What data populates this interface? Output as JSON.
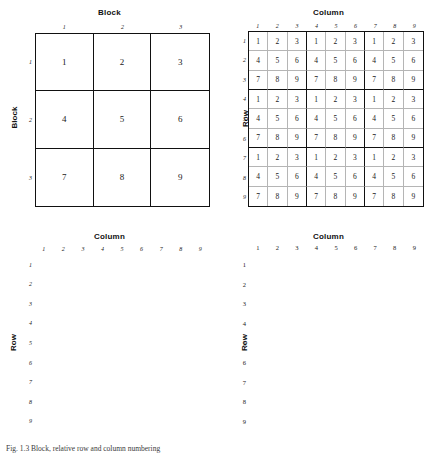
{
  "figure": {
    "caption": "Fig. 1.3 Block, relative row and column numbering"
  },
  "panels": [
    {
      "id": "block",
      "top_label": "Block",
      "side_label": "Block",
      "column_indices": [
        "1",
        "2",
        "3"
      ],
      "row_indices": [
        "1",
        "2",
        "3"
      ],
      "index_style": "italic",
      "grid_size": 3,
      "cells": [
        [
          "1",
          "2",
          "3"
        ],
        [
          "4",
          "5",
          "6"
        ],
        [
          "7",
          "8",
          "9"
        ]
      ]
    },
    {
      "id": "digits",
      "top_label": "Column",
      "side_label": "Row",
      "column_indices": [
        "1",
        "2",
        "3",
        "4",
        "5",
        "6",
        "7",
        "8",
        "9"
      ],
      "row_indices": [
        "1",
        "2",
        "3",
        "4",
        "5",
        "6",
        "7",
        "8",
        "9"
      ],
      "index_style": "italic",
      "grid_size": 9,
      "cells": [
        [
          "1",
          "2",
          "3",
          "1",
          "2",
          "3",
          "1",
          "2",
          "3"
        ],
        [
          "4",
          "5",
          "6",
          "4",
          "5",
          "6",
          "4",
          "5",
          "6"
        ],
        [
          "7",
          "8",
          "9",
          "7",
          "8",
          "9",
          "7",
          "8",
          "9"
        ],
        [
          "1",
          "2",
          "3",
          "1",
          "2",
          "3",
          "1",
          "2",
          "3"
        ],
        [
          "4",
          "5",
          "6",
          "4",
          "5",
          "6",
          "4",
          "5",
          "6"
        ],
        [
          "7",
          "8",
          "9",
          "7",
          "8",
          "9",
          "7",
          "8",
          "9"
        ],
        [
          "1",
          "2",
          "3",
          "1",
          "2",
          "3",
          "1",
          "2",
          "3"
        ],
        [
          "4",
          "5",
          "6",
          "4",
          "5",
          "6",
          "4",
          "5",
          "6"
        ],
        [
          "7",
          "8",
          "9",
          "7",
          "8",
          "9",
          "7",
          "8",
          "9"
        ]
      ]
    },
    {
      "id": "rowcol",
      "top_label": "Column",
      "side_label": "Row",
      "column_indices": [
        "1",
        "2",
        "3",
        "4",
        "5",
        "6",
        "7",
        "8",
        "9"
      ],
      "row_indices": [
        "1",
        "2",
        "3",
        "4",
        "5",
        "6",
        "7",
        "8",
        "9"
      ],
      "index_style": "italic",
      "grid_size": 9,
      "cells": [
        [
          "1,1",
          "1,2",
          "1,3",
          "1,4",
          "1,5",
          "1,6",
          "1,7",
          "1,8",
          "1,9"
        ],
        [
          "2,1",
          "2,2",
          "2,3",
          "2,4",
          "2,5",
          "2,6",
          "2,7",
          "2,8",
          "2,9"
        ],
        [
          "3,1",
          "3,2",
          "3,3",
          "3,4",
          "3,5",
          "3,6",
          "3,7",
          "3,8",
          "3,9"
        ],
        [
          "4,1",
          "4,2",
          "4,3",
          "4,4",
          "4,5",
          "4,6",
          "4,7",
          "4,8",
          "4,9"
        ],
        [
          "5,1",
          "5,2",
          "5,3",
          "5,4",
          "5,5",
          "5,6",
          "5,7",
          "5,8",
          "5,9"
        ],
        [
          "6,1",
          "6,2",
          "6,3",
          "6,4",
          "6,5",
          "6,6",
          "6,7",
          "6,8",
          "6,9"
        ],
        [
          "7,1",
          "7,2",
          "7,3",
          "7,4",
          "7,5",
          "7,6",
          "7,7",
          "7,8",
          "7,9"
        ],
        [
          "8,1",
          "8,2",
          "8,3",
          "8,4",
          "8,5",
          "8,6",
          "8,7",
          "8,8",
          "8,9"
        ],
        [
          "9,1",
          "9,2",
          "9,3",
          "9,4",
          "9,5",
          "9,6",
          "9,7",
          "9,8",
          "9,9"
        ]
      ]
    },
    {
      "id": "triple",
      "top_label": "Column",
      "side_label": "Row",
      "column_indices": [
        "1",
        "2",
        "3",
        "4",
        "5",
        "6",
        "7",
        "8",
        "9"
      ],
      "row_indices": [
        "1",
        "2",
        "3",
        "4",
        "5",
        "6",
        "7",
        "8",
        "9"
      ],
      "index_style": "upright",
      "grid_size": 9,
      "cells": [
        [
          "1,1,1",
          "1,1,2",
          "1,1,3",
          "2,1,4",
          "2,1,5",
          "2,1,6",
          "3,1,7",
          "3,1,8",
          "3,1,9"
        ],
        [
          "1,2,1",
          "1,2,2",
          "1,2,3",
          "2,2,4",
          "2,2,5",
          "2,2,6",
          "3,2,7",
          "3,2,8",
          "3,2,9"
        ],
        [
          "1,3,1",
          "1,3,2",
          "1,3,3",
          "2,3,4",
          "2,3,5",
          "2,3,6",
          "3,3,7",
          "3,3,8",
          "3,3,9"
        ],
        [
          "4,4,1",
          "4,4,2",
          "4,4,3",
          "5,4,4",
          "5,4,5",
          "5,4,6",
          "6,4,7",
          "6,4,8",
          "6,4,9"
        ],
        [
          "4,5,1",
          "4,5,2",
          "4,5,3",
          "5,5,4",
          "5,5,5",
          "5,5,6",
          "6,5,7",
          "6,5,8",
          "6,5,9"
        ],
        [
          "4,6,1",
          "4,6,2",
          "4,6,3",
          "5,6,4",
          "5,6,5",
          "5,6,6",
          "6,6,7",
          "6,6,8",
          "6,6,9"
        ],
        [
          "7,7,1",
          "7,7,2",
          "7,7,3",
          "8,7,4",
          "8,7,5",
          "8,7,6",
          "9,7,7",
          "9,7,8",
          "9,7,9"
        ],
        [
          "7,8,1",
          "7,8,2",
          "7,8,3",
          "8,8,4",
          "8,8,5",
          "8,8,6",
          "9,8,7",
          "9,8,8",
          "9,8,9"
        ],
        [
          "7,9,1",
          "7,9,2",
          "7,9,3",
          "8,9,4",
          "8,9,5",
          "8,9,6",
          "9,9,7",
          "9,9,8",
          "9,9,9"
        ]
      ]
    }
  ]
}
